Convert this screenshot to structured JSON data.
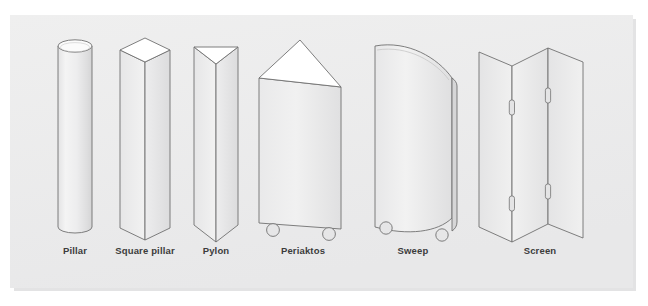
{
  "figure": {
    "name": "scenic-units-illustration",
    "background_color": "#ffffff",
    "panel_color": "#ececed",
    "panel_shadow_color": "#e2e2e3",
    "outline_color": "#6e6e6e",
    "label_color": "#3c3c3c",
    "face_light": "#f6f6f6",
    "face_mid": "#e9e9ea",
    "face_shadow": "#dcdcdd",
    "face_top": "#ffffff"
  },
  "units": [
    {
      "id": "pillar",
      "label": "Pillar",
      "shape": "cylinder",
      "label_x": 75,
      "details": "round column with elliptical top"
    },
    {
      "id": "square-pillar",
      "label": "Square pillar",
      "shape": "rectangular-prism",
      "label_x": 145,
      "details": "square box column with visible top face"
    },
    {
      "id": "pylon",
      "label": "Pylon",
      "shape": "triangular-prism",
      "label_x": 216,
      "details": "three sided narrow prism"
    },
    {
      "id": "periaktos",
      "label": "Periaktos",
      "shape": "triangular-prism-wide",
      "label_x": 303,
      "details": "wide rotating three sided unit on casters",
      "casters": 2
    },
    {
      "id": "sweep",
      "label": "Sweep",
      "shape": "curved-panel",
      "label_x": 413,
      "details": "curved flat panel on casters",
      "casters": 2
    },
    {
      "id": "screen",
      "label": "Screen",
      "shape": "folding-panels",
      "label_x": 540,
      "details": "three hinged flats in zigzag",
      "panels": 3,
      "hinges": 4
    }
  ],
  "label_baseline_y": 254
}
